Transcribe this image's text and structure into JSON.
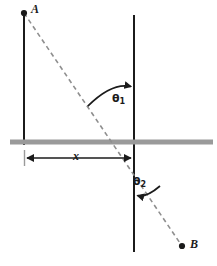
{
  "figure": {
    "name": "refraction-ray-diagram",
    "background_color": "#ffffff"
  },
  "colors": {
    "line": "#1b1b1b",
    "dashed_ray": "#8a8a8a",
    "boundary_bar": "#9a9a9a",
    "text": "#1b1b1b"
  },
  "points": [
    {
      "id": "A",
      "label": "A",
      "x": 24,
      "y": 13,
      "role": "source-point"
    },
    {
      "id": "B",
      "label": "B",
      "x": 182,
      "y": 246,
      "role": "destination-point"
    }
  ],
  "labels": {
    "point_a": "A",
    "point_b": "B",
    "distance_x": "x",
    "theta1_base": "θ",
    "theta1_sub": "1",
    "theta2_base": "θ",
    "theta2_sub": "2"
  },
  "geometry": {
    "left_vertical_line": {
      "x": 24,
      "y_top": 13,
      "y_bottom": 144
    },
    "right_vertical_line": {
      "x": 134,
      "y_top": 15,
      "y_bottom": 252
    },
    "boundary_bar": {
      "x_start": 10,
      "x_end": 213,
      "y": 142,
      "thickness": 5
    },
    "dashed_ray": {
      "x1": 24,
      "y1": 13,
      "x2": 182,
      "y2": 246
    },
    "dimension_arrow_x": {
      "x_start": 25,
      "x_end": 133,
      "y": 158
    },
    "angle_arc_theta1": {
      "cx": 134,
      "cy": 142,
      "radius": 57,
      "from_deg": 214,
      "to_deg": 270
    },
    "angle_arc_theta2": {
      "cx": 134,
      "cy": 142,
      "radius": 48,
      "from_deg": 90,
      "to_deg": 34
    }
  }
}
